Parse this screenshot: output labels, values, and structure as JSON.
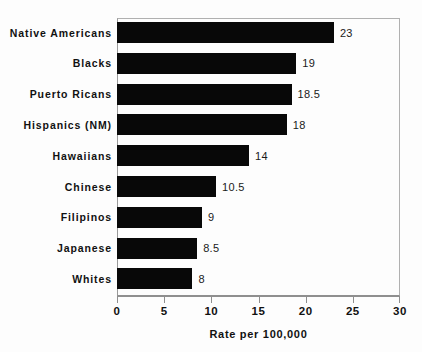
{
  "chart_data": {
    "type": "bar",
    "orientation": "horizontal",
    "title": "",
    "xlabel": "Rate per 100,000",
    "ylabel": "",
    "xlim": [
      0,
      30
    ],
    "xticks": [
      0,
      5,
      10,
      15,
      20,
      25,
      30
    ],
    "grid": false,
    "legend": null,
    "bar_color": "#080808",
    "categories": [
      "Native Americans",
      "Blacks",
      "Puerto Ricans",
      "Hispanics (NM)",
      "Hawaiians",
      "Chinese",
      "Filipinos",
      "Japanese",
      "Whites"
    ],
    "values": [
      23,
      19,
      18.5,
      18,
      14,
      10.5,
      9,
      8.5,
      8
    ],
    "value_labels": [
      "23",
      "19",
      "18.5",
      "18",
      "14",
      "10.5",
      "9",
      "8.5",
      "8"
    ],
    "tick_labels": [
      "0",
      "5",
      "10",
      "15",
      "20",
      "25",
      "30"
    ]
  }
}
